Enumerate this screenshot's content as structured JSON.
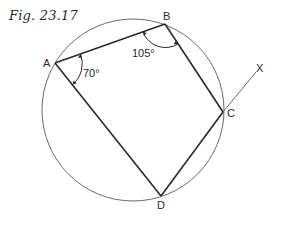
{
  "figure": {
    "title": "Fig. 23.17",
    "points": {
      "A": {
        "label": "A",
        "x": 55,
        "y": 63
      },
      "B": {
        "label": "B",
        "x": 165,
        "y": 24
      },
      "C": {
        "label": "C",
        "x": 223,
        "y": 112
      },
      "D": {
        "label": "D",
        "x": 161,
        "y": 196
      },
      "X": {
        "label": "X",
        "x": 258,
        "y": 68
      }
    },
    "circle": {
      "cx": 133,
      "cy": 110,
      "r": 91
    },
    "angles": {
      "A": "70°",
      "B": "105°"
    },
    "colors": {
      "line": "#2a2a2a",
      "circle": "#6a6a6a"
    }
  }
}
